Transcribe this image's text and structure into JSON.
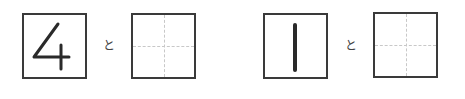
{
  "problems": [
    {
      "given_number": "4",
      "connector": "と",
      "answer_box": {
        "value": "",
        "grid": "quartered-dotted"
      }
    },
    {
      "given_number": "1",
      "connector": "と",
      "answer_box": {
        "value": "",
        "grid": "quartered-dotted"
      }
    }
  ],
  "colors": {
    "border": "#3a3a3a",
    "digit": "#2a2a2a",
    "guide_lines": "#c8c8c8"
  }
}
